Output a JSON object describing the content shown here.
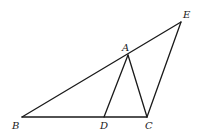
{
  "diagram": {
    "type": "geometry-figure",
    "points": {
      "A": {
        "x": 128,
        "y": 55,
        "label": "A",
        "label_x": 122,
        "label_y": 51
      },
      "B": {
        "x": 22,
        "y": 117,
        "label": "B",
        "label_x": 12,
        "label_y": 129
      },
      "C": {
        "x": 147,
        "y": 117,
        "label": "C",
        "label_x": 145,
        "label_y": 129
      },
      "D": {
        "x": 104,
        "y": 117,
        "label": "D",
        "label_x": 100,
        "label_y": 129
      },
      "E": {
        "x": 181,
        "y": 22,
        "label": "E",
        "label_x": 183,
        "label_y": 18
      }
    },
    "segments": [
      {
        "from": "B",
        "to": "E",
        "name": "segment-be"
      },
      {
        "from": "B",
        "to": "C",
        "name": "segment-bc"
      },
      {
        "from": "A",
        "to": "D",
        "name": "segment-ad"
      },
      {
        "from": "A",
        "to": "C",
        "name": "segment-ac"
      },
      {
        "from": "C",
        "to": "E",
        "name": "segment-ce"
      }
    ],
    "colors": {
      "stroke": "#1a1a1a",
      "background": "#ffffff"
    }
  }
}
